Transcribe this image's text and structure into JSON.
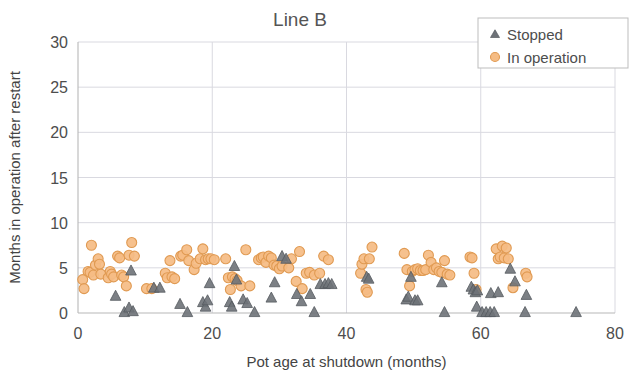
{
  "chart_data": {
    "type": "scatter",
    "title": "Line B",
    "xlabel": "Pot age at shutdown  (months)",
    "ylabel": "Months  in operation after restart",
    "xlim": [
      0,
      80
    ],
    "ylim": [
      0,
      30
    ],
    "xticks": [
      "0",
      "20",
      "40",
      "60",
      "80"
    ],
    "xtick_values": [
      0,
      20,
      40,
      60,
      80
    ],
    "yticks": [
      "0",
      "5",
      "10",
      "15",
      "20",
      "25",
      "30"
    ],
    "ytick_values": [
      0,
      5,
      10,
      15,
      20,
      25,
      30
    ],
    "grid": true,
    "legend_position": "top-right",
    "colors": {
      "stopped": "#6e7278",
      "in_operation": "#f5bc84",
      "in_operation_edge": "#e09a52",
      "grid": "#d9d9e0",
      "axis": "#b8b8b8",
      "text": "#4d4d4d"
    },
    "series": [
      {
        "name": "Stopped",
        "marker": "triangle",
        "color": "#6e7278",
        "points": [
          [
            5.6,
            1.9
          ],
          [
            6.9,
            0.1
          ],
          [
            7.6,
            0.6
          ],
          [
            7.9,
            4.7
          ],
          [
            8.2,
            0.2
          ],
          [
            11.3,
            2.8
          ],
          [
            12.2,
            2.8
          ],
          [
            15.2,
            1.0
          ],
          [
            16.3,
            0.1
          ],
          [
            18.6,
            1.2
          ],
          [
            19.0,
            0.7
          ],
          [
            19.3,
            1.4
          ],
          [
            19.6,
            3.3
          ],
          [
            22.6,
            1.2
          ],
          [
            22.9,
            0.7
          ],
          [
            23.3,
            5.2
          ],
          [
            23.6,
            3.7
          ],
          [
            24.6,
            1.5
          ],
          [
            25.2,
            1.1
          ],
          [
            26.3,
            0.1
          ],
          [
            28.8,
            1.7
          ],
          [
            29.3,
            3.4
          ],
          [
            30.4,
            6.3
          ],
          [
            31.0,
            6.0
          ],
          [
            32.6,
            2.1
          ],
          [
            33.3,
            1.3
          ],
          [
            34.6,
            2.1
          ],
          [
            35.2,
            0.1
          ],
          [
            36.1,
            3.2
          ],
          [
            36.8,
            3.2
          ],
          [
            37.3,
            3.3
          ],
          [
            37.8,
            3.2
          ],
          [
            43.0,
            4.0
          ],
          [
            43.3,
            3.8
          ],
          [
            48.9,
            1.5
          ],
          [
            49.2,
            1.8
          ],
          [
            49.6,
            4.0
          ],
          [
            50.2,
            1.4
          ],
          [
            50.6,
            1.4
          ],
          [
            54.2,
            3.4
          ],
          [
            54.6,
            0.1
          ],
          [
            58.6,
            2.9
          ],
          [
            58.9,
            2.6
          ],
          [
            59.2,
            2.3
          ],
          [
            59.5,
            2.5
          ],
          [
            59.4,
            0.7
          ],
          [
            60.2,
            0.1
          ],
          [
            60.8,
            0.1
          ],
          [
            61.4,
            0.1
          ],
          [
            61.5,
            2.2
          ],
          [
            62.0,
            0.1
          ],
          [
            62.6,
            2.3
          ],
          [
            64.4,
            4.9
          ],
          [
            65.1,
            3.5
          ],
          [
            66.6,
            0.1
          ],
          [
            66.8,
            2.0
          ],
          [
            74.2,
            0.1
          ]
        ]
      },
      {
        "name": "In operation",
        "marker": "circle",
        "color": "#f5bc84",
        "points": [
          [
            0.7,
            3.7
          ],
          [
            0.9,
            2.7
          ],
          [
            1.5,
            4.6
          ],
          [
            1.8,
            4.5
          ],
          [
            2.0,
            7.5
          ],
          [
            2.3,
            4.2
          ],
          [
            2.6,
            5.3
          ],
          [
            3.0,
            6.0
          ],
          [
            3.2,
            5.4
          ],
          [
            3.4,
            4.3
          ],
          [
            4.5,
            3.9
          ],
          [
            4.8,
            4.6
          ],
          [
            5.0,
            4.3
          ],
          [
            5.3,
            4.0
          ],
          [
            5.9,
            6.3
          ],
          [
            6.2,
            6.1
          ],
          [
            6.5,
            4.2
          ],
          [
            6.8,
            4.0
          ],
          [
            7.2,
            3.0
          ],
          [
            7.6,
            6.4
          ],
          [
            8.0,
            7.8
          ],
          [
            8.4,
            6.3
          ],
          [
            10.2,
            2.7
          ],
          [
            11.0,
            2.7
          ],
          [
            13.0,
            4.4
          ],
          [
            13.3,
            3.9
          ],
          [
            13.7,
            5.8
          ],
          [
            14.0,
            4.0
          ],
          [
            14.4,
            3.8
          ],
          [
            15.3,
            6.3
          ],
          [
            15.6,
            6.4
          ],
          [
            16.2,
            7.0
          ],
          [
            16.5,
            5.8
          ],
          [
            17.3,
            4.8
          ],
          [
            17.6,
            5.5
          ],
          [
            18.2,
            6.0
          ],
          [
            18.6,
            7.1
          ],
          [
            19.0,
            5.9
          ],
          [
            19.4,
            6.0
          ],
          [
            19.8,
            6.0
          ],
          [
            20.3,
            5.9
          ],
          [
            22.0,
            6.0
          ],
          [
            22.4,
            3.9
          ],
          [
            22.7,
            2.6
          ],
          [
            23.0,
            4.0
          ],
          [
            23.4,
            3.8
          ],
          [
            23.7,
            3.6
          ],
          [
            24.3,
            3.0
          ],
          [
            25.0,
            7.0
          ],
          [
            25.6,
            3.0
          ],
          [
            26.9,
            5.9
          ],
          [
            27.3,
            6.1
          ],
          [
            27.6,
            6.2
          ],
          [
            28.0,
            5.6
          ],
          [
            28.4,
            6.3
          ],
          [
            28.8,
            6.1
          ],
          [
            29.2,
            5.3
          ],
          [
            29.6,
            5.2
          ],
          [
            30.0,
            4.9
          ],
          [
            30.4,
            5.2
          ],
          [
            31.4,
            5.0
          ],
          [
            31.8,
            6.0
          ],
          [
            32.5,
            3.5
          ],
          [
            33.0,
            6.8
          ],
          [
            33.4,
            2.7
          ],
          [
            34.0,
            4.4
          ],
          [
            34.5,
            4.5
          ],
          [
            35.2,
            4.2
          ],
          [
            36.0,
            4.4
          ],
          [
            36.6,
            6.3
          ],
          [
            37.3,
            5.9
          ],
          [
            42.1,
            4.4
          ],
          [
            42.3,
            5.4
          ],
          [
            42.6,
            6.0
          ],
          [
            42.9,
            2.6
          ],
          [
            43.1,
            2.3
          ],
          [
            43.4,
            6.0
          ],
          [
            43.8,
            7.3
          ],
          [
            48.6,
            6.6
          ],
          [
            49.0,
            4.8
          ],
          [
            49.4,
            3.0
          ],
          [
            49.8,
            4.6
          ],
          [
            50.2,
            4.8
          ],
          [
            50.6,
            4.9
          ],
          [
            51.0,
            4.7
          ],
          [
            51.4,
            4.7
          ],
          [
            51.8,
            4.8
          ],
          [
            52.2,
            6.4
          ],
          [
            52.6,
            5.6
          ],
          [
            53.0,
            4.8
          ],
          [
            53.4,
            5.0
          ],
          [
            53.8,
            4.6
          ],
          [
            54.2,
            4.5
          ],
          [
            54.6,
            5.8
          ],
          [
            55.0,
            4.3
          ],
          [
            55.4,
            4.2
          ],
          [
            58.4,
            6.2
          ],
          [
            58.7,
            6.1
          ],
          [
            59.0,
            4.4
          ],
          [
            59.3,
            2.6
          ],
          [
            62.3,
            7.1
          ],
          [
            62.6,
            6.0
          ],
          [
            62.9,
            6.2
          ],
          [
            63.2,
            7.4
          ],
          [
            63.5,
            6.1
          ],
          [
            63.8,
            7.2
          ],
          [
            64.1,
            6.0
          ],
          [
            64.8,
            2.8
          ],
          [
            66.7,
            4.4
          ],
          [
            66.9,
            4.0
          ]
        ]
      }
    ]
  },
  "legend": {
    "items": [
      {
        "label": "Stopped",
        "marker": "triangle"
      },
      {
        "label": "In operation",
        "marker": "circle"
      }
    ]
  }
}
